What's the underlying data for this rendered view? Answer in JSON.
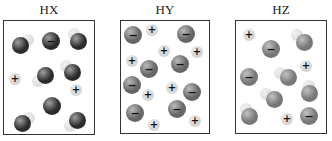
{
  "colors": {
    "cation": "#d6d6d6",
    "hydrogen": "#e0e0e0",
    "hx_anion": "#2b2b2b",
    "hy_anion": "#666666",
    "hz_anion": "#777777"
  },
  "panels": [
    {
      "label": "HX",
      "box": {
        "left": 3,
        "top": 20,
        "width": 92,
        "height": 115
      },
      "anion_color": "#2b2b2b",
      "ions": [
        {
          "type": "anion",
          "x": 51,
          "y": 41,
          "sym": "−"
        },
        {
          "type": "cation",
          "x": 15,
          "y": 79,
          "sym": "+"
        },
        {
          "type": "cation",
          "x": 76,
          "y": 90,
          "sym": "+"
        },
        {
          "type": "anion",
          "x": 52,
          "y": 106,
          "sym": ""
        }
      ],
      "molecules": [
        {
          "hx": 28,
          "hy": 40,
          "ax": 20,
          "ay": 45
        },
        {
          "hx": 74,
          "hy": 34,
          "ax": 78,
          "ay": 41
        },
        {
          "hx": 38,
          "hy": 81,
          "ax": 45,
          "ay": 75
        },
        {
          "hx": 66,
          "hy": 66,
          "ax": 72,
          "ay": 72
        },
        {
          "hx": 29,
          "hy": 118,
          "ax": 22,
          "ay": 123
        },
        {
          "hx": 70,
          "hy": 126,
          "ax": 77,
          "ay": 120
        }
      ]
    },
    {
      "label": "HY",
      "box": {
        "left": 120,
        "top": 20,
        "width": 90,
        "height": 114
      },
      "anion_color": "#666666",
      "ions": [
        {
          "type": "anion",
          "x": 133,
          "y": 35,
          "sym": "−"
        },
        {
          "type": "cation",
          "x": 152,
          "y": 30,
          "sym": "+"
        },
        {
          "type": "anion",
          "x": 186,
          "y": 34,
          "sym": "−"
        },
        {
          "type": "cation",
          "x": 164,
          "y": 51,
          "sym": "+"
        },
        {
          "type": "cation",
          "x": 197,
          "y": 52,
          "sym": "+"
        },
        {
          "type": "cation",
          "x": 132,
          "y": 61,
          "sym": "+"
        },
        {
          "type": "anion",
          "x": 149,
          "y": 69,
          "sym": "−"
        },
        {
          "type": "anion",
          "x": 180,
          "y": 64,
          "sym": "−"
        },
        {
          "type": "anion",
          "x": 132,
          "y": 85,
          "sym": "−"
        },
        {
          "type": "cation",
          "x": 148,
          "y": 95,
          "sym": "+"
        },
        {
          "type": "cation",
          "x": 172,
          "y": 88,
          "sym": "+"
        },
        {
          "type": "anion",
          "x": 192,
          "y": 92,
          "sym": "−"
        },
        {
          "type": "anion",
          "x": 135,
          "y": 113,
          "sym": "−"
        },
        {
          "type": "anion",
          "x": 177,
          "y": 109,
          "sym": "−"
        },
        {
          "type": "cation",
          "x": 154,
          "y": 125,
          "sym": "+"
        },
        {
          "type": "cation",
          "x": 195,
          "y": 121,
          "sym": "+"
        }
      ],
      "molecules": []
    },
    {
      "label": "HZ",
      "box": {
        "left": 235,
        "top": 20,
        "width": 92,
        "height": 114
      },
      "anion_color": "#777777",
      "ions": [
        {
          "type": "cation",
          "x": 249,
          "y": 35,
          "sym": "+"
        },
        {
          "type": "anion",
          "x": 271,
          "y": 49,
          "sym": "−"
        },
        {
          "type": "cation",
          "x": 306,
          "y": 66,
          "sym": "+"
        },
        {
          "type": "anion",
          "x": 249,
          "y": 77,
          "sym": "−"
        },
        {
          "type": "cation",
          "x": 287,
          "y": 119,
          "sym": "+"
        },
        {
          "type": "anion",
          "x": 309,
          "y": 116,
          "sym": "−"
        }
      ],
      "molecules": [
        {
          "hx": 297,
          "hy": 35,
          "ax": 304,
          "ay": 42
        },
        {
          "hx": 280,
          "hy": 73,
          "ax": 288,
          "ay": 77
        },
        {
          "hx": 266,
          "hy": 94,
          "ax": 274,
          "ay": 99
        },
        {
          "hx": 309,
          "hy": 86,
          "ax": 309,
          "ay": 93
        },
        {
          "hx": 246,
          "hy": 109,
          "ax": 249,
          "ay": 116
        }
      ]
    }
  ]
}
